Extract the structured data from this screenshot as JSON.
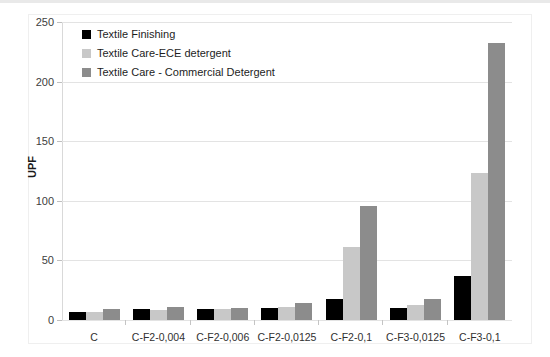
{
  "chart_data": {
    "type": "bar",
    "title": "",
    "xlabel": "",
    "ylabel": "UPF",
    "ylim": [
      0,
      250
    ],
    "ytick_step": 50,
    "yticks": [
      0,
      50,
      100,
      150,
      200,
      250
    ],
    "grid": true,
    "legend_position": "inside-top-left",
    "categories": [
      "C",
      "C-F2-0,004",
      "C-F2-0,006",
      "C-F2-0,0125",
      "C-F2-0,1",
      "C-F3-0,0125",
      "C-F3-0,1"
    ],
    "series": [
      {
        "name": "Textile Finishing",
        "color": "#000000",
        "values": [
          7,
          9,
          9,
          10,
          18,
          10,
          37
        ]
      },
      {
        "name": "Textile Care-ECE detergent",
        "color": "#c8c8c8",
        "values": [
          7,
          8,
          9,
          11,
          61,
          13,
          123
        ]
      },
      {
        "name": "Textile Care - Commercial Detergent",
        "color": "#8c8c8c",
        "values": [
          9,
          11,
          10,
          14,
          96,
          18,
          232
        ]
      }
    ]
  },
  "axis": {
    "y_tick_labels": [
      "0",
      "50",
      "100",
      "150",
      "200",
      "250"
    ],
    "y_title": "UPF"
  },
  "legend": {
    "items": [
      {
        "label": "Textile Finishing",
        "color": "#000000"
      },
      {
        "label": "Textile Care-ECE detergent",
        "color": "#c8c8c8"
      },
      {
        "label": "Textile Care - Commercial Detergent",
        "color": "#8c8c8c"
      }
    ]
  }
}
